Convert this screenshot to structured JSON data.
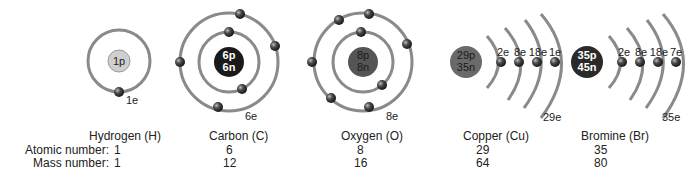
{
  "row_labels": {
    "atomic": "Atomic number:",
    "mass": "Mass number:"
  },
  "colors": {
    "orbit": "#8a8a8a",
    "electron": "#3a3a3a",
    "nucleus_h": "#cfcfcf",
    "nucleus_c": "#1a1a1a",
    "nucleus_o": "#555555",
    "nucleus_cu": "#6a6a6a",
    "nucleus_br": "#2a2a2a"
  },
  "atoms": [
    {
      "name": "Hydrogen (H)",
      "nucleus_line1": "1p",
      "nucleus_line2": "",
      "electrons": "1e",
      "atomic_number": "1",
      "mass_number": "1"
    },
    {
      "name": "Carbon (C)",
      "nucleus_line1": "6p",
      "nucleus_line2": "6n",
      "electrons": "6e",
      "atomic_number": "6",
      "mass_number": "12"
    },
    {
      "name": "Oxygen (O)",
      "nucleus_line1": "8p",
      "nucleus_line2": "8n",
      "electrons": "8e",
      "atomic_number": "8",
      "mass_number": "16"
    },
    {
      "name": "Copper (Cu)",
      "nucleus_line1": "29p",
      "nucleus_line2": "35n",
      "electrons": "29e",
      "shells": [
        "2e",
        "8e",
        "18e",
        "1e"
      ],
      "atomic_number": "29",
      "mass_number": "64"
    },
    {
      "name": "Bromine (Br)",
      "nucleus_line1": "35p",
      "nucleus_line2": "45n",
      "electrons": "35e",
      "shells": [
        "2e",
        "8e",
        "18e",
        "7e"
      ],
      "atomic_number": "35",
      "mass_number": "80"
    }
  ]
}
